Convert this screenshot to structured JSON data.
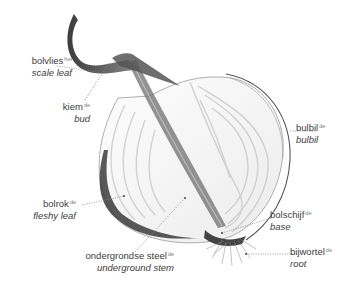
{
  "diagram": {
    "labels": [
      {
        "id": "scale-leaf",
        "nl": "bolvlies",
        "article": "het",
        "en": "scale leaf"
      },
      {
        "id": "bud",
        "nl": "kiem",
        "article": "de",
        "en": "bud"
      },
      {
        "id": "bulbil",
        "nl": "bulbil",
        "article": "de",
        "en": "bulbil"
      },
      {
        "id": "fleshy-leaf",
        "nl": "bolrok",
        "article": "de",
        "en": "fleshy leaf"
      },
      {
        "id": "base",
        "nl": "bolschijf",
        "article": "de",
        "en": "base"
      },
      {
        "id": "underground-stem",
        "nl": "ondergrondse steel",
        "article": "de",
        "en": "underground stem"
      },
      {
        "id": "root",
        "nl": "bijwortel",
        "article": "de",
        "en": "root"
      }
    ]
  }
}
